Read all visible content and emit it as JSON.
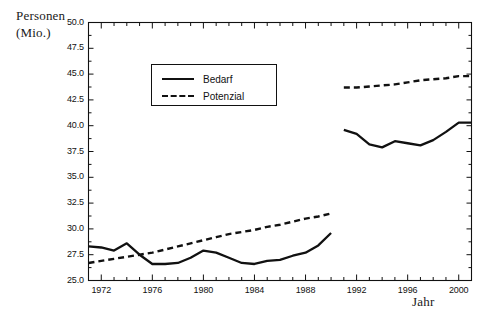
{
  "chart_data": {
    "type": "line",
    "title": "",
    "ylabel_line1": "Personen",
    "ylabel_line2": "(Mio.)",
    "xlabel": "Jahr",
    "xlim": [
      1971,
      2001
    ],
    "ylim": [
      25.0,
      50.0
    ],
    "grid": false,
    "legend_position": "upper-center-left",
    "y_ticks": [
      "50.0",
      "47.5",
      "45.0",
      "42.5",
      "40.0",
      "37.5",
      "35.0",
      "32.5",
      "30.0",
      "27.5",
      "25.0"
    ],
    "y_tick_values": [
      50.0,
      47.5,
      45.0,
      42.5,
      40.0,
      37.5,
      35.0,
      32.5,
      30.0,
      27.5,
      25.0
    ],
    "x_ticks": [
      "1972",
      "1976",
      "1980",
      "1984",
      "1988",
      "1992",
      "1996",
      "2000"
    ],
    "x_tick_values": [
      1972,
      1976,
      1980,
      1984,
      1988,
      1992,
      1996,
      2000
    ],
    "x_minor_step": 1,
    "series": [
      {
        "name": "Bedarf",
        "style": "solid",
        "color": "#111111",
        "segments": [
          {
            "label": "west-germany",
            "x": [
              1971,
              1972,
              1973,
              1974,
              1975,
              1976,
              1977,
              1978,
              1979,
              1980,
              1981,
              1982,
              1983,
              1984,
              1985,
              1986,
              1987,
              1988,
              1989,
              1990
            ],
            "values": [
              28.3,
              28.2,
              27.9,
              28.6,
              27.5,
              26.6,
              26.6,
              26.7,
              27.2,
              27.9,
              27.7,
              27.2,
              26.7,
              26.6,
              26.9,
              27.0,
              27.4,
              27.7,
              28.4,
              29.6
            ]
          },
          {
            "label": "reunified-germany",
            "x": [
              1991,
              1992,
              1993,
              1994,
              1995,
              1996,
              1997,
              1998,
              1999,
              2000,
              2001
            ],
            "values": [
              39.6,
              39.2,
              38.2,
              37.9,
              38.5,
              38.3,
              38.1,
              38.6,
              39.4,
              40.3,
              40.3
            ]
          }
        ]
      },
      {
        "name": "Potenzial",
        "style": "dashed",
        "color": "#111111",
        "segments": [
          {
            "label": "west-germany",
            "x": [
              1971,
              1972,
              1973,
              1974,
              1975,
              1976,
              1977,
              1978,
              1979,
              1980,
              1981,
              1982,
              1983,
              1984,
              1985,
              1986,
              1987,
              1988,
              1989,
              1990
            ],
            "values": [
              26.7,
              26.9,
              27.1,
              27.3,
              27.5,
              27.7,
              28.0,
              28.3,
              28.6,
              28.9,
              29.2,
              29.5,
              29.7,
              29.9,
              30.2,
              30.4,
              30.7,
              31.0,
              31.2,
              31.5
            ]
          },
          {
            "label": "reunified-germany",
            "x": [
              1991,
              1992,
              1993,
              1994,
              1995,
              1996,
              1997,
              1998,
              1999,
              2000,
              2001
            ],
            "values": [
              43.7,
              43.7,
              43.8,
              43.9,
              44.0,
              44.2,
              44.4,
              44.5,
              44.6,
              44.8,
              44.8
            ]
          }
        ]
      }
    ]
  },
  "legend": {
    "items": [
      {
        "label": "Bedarf",
        "style": "solid"
      },
      {
        "label": "Potenzial",
        "style": "dashed"
      }
    ]
  },
  "colors": {
    "line": "#111111",
    "frame": "#111111",
    "background": "#ffffff"
  }
}
